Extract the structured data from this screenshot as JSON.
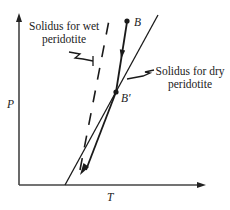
{
  "diagram": {
    "axes": {
      "y_label": "P",
      "x_label": "T"
    },
    "labels": {
      "wet_solidus_line1": "Solidus for wet",
      "wet_solidus_line2": "peridotite",
      "dry_solidus_line1": "Solidus for dry",
      "dry_solidus_line2": "peridotite",
      "point_b": "B",
      "point_b_prime": "B′"
    },
    "colors": {
      "ink": "#1a1a1a",
      "axis": "#444444",
      "background": "#ffffff"
    }
  }
}
